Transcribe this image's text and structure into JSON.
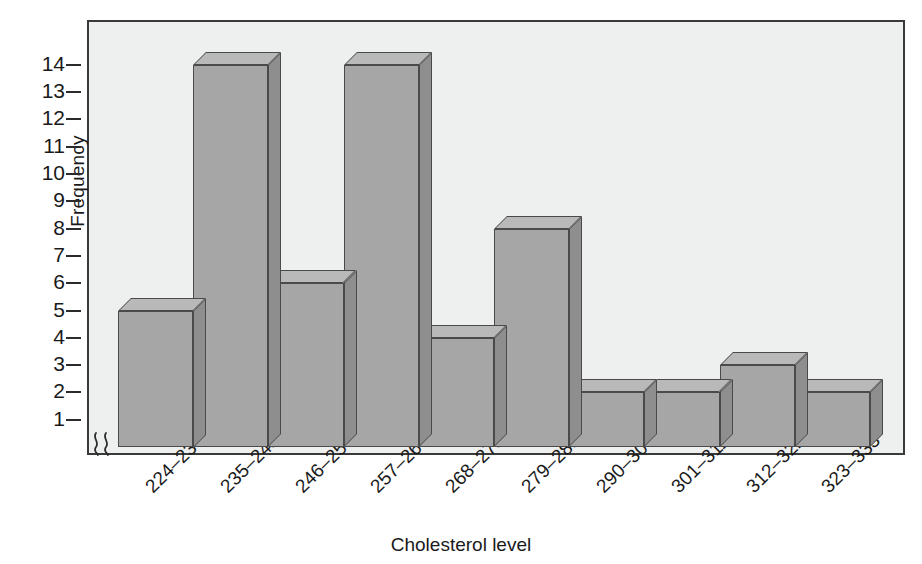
{
  "chart_data": {
    "type": "bar",
    "title": "",
    "subtitle": "",
    "xlabel": "Cholesterol level",
    "ylabel": "Frequency",
    "categories": [
      "224–234",
      "235–245",
      "246–256",
      "257–267",
      "268–278",
      "279–289",
      "290–300",
      "301–311",
      "312–322",
      "323–333"
    ],
    "values": [
      5,
      14,
      6,
      14,
      4,
      8,
      2,
      2,
      3,
      2
    ],
    "ytick_labels": [
      "14",
      "13",
      "12",
      "11",
      "10",
      "9",
      "8",
      "7",
      "6",
      "5",
      "4",
      "3",
      "2",
      "1"
    ],
    "ytick_values": [
      14,
      13,
      12,
      11,
      10,
      9,
      8,
      7,
      6,
      5,
      4,
      3,
      2,
      1
    ],
    "ylim": [
      0,
      15
    ],
    "y_axis_broken": true,
    "axis_break_symbol": "≈",
    "grid": false,
    "legend": null,
    "annotations": [],
    "style": {
      "bar_face_color": "#a6a6a6",
      "bar_top_color": "#b9b9b9",
      "bar_side_color": "#8e8e8e",
      "bar_edge_color": "#4a4a4a",
      "plot_background": "#eef0ef",
      "frame_color": "#3a3a3a",
      "page_background": "#ffffff",
      "text_color": "#1a1a1a",
      "three_d": true
    }
  }
}
